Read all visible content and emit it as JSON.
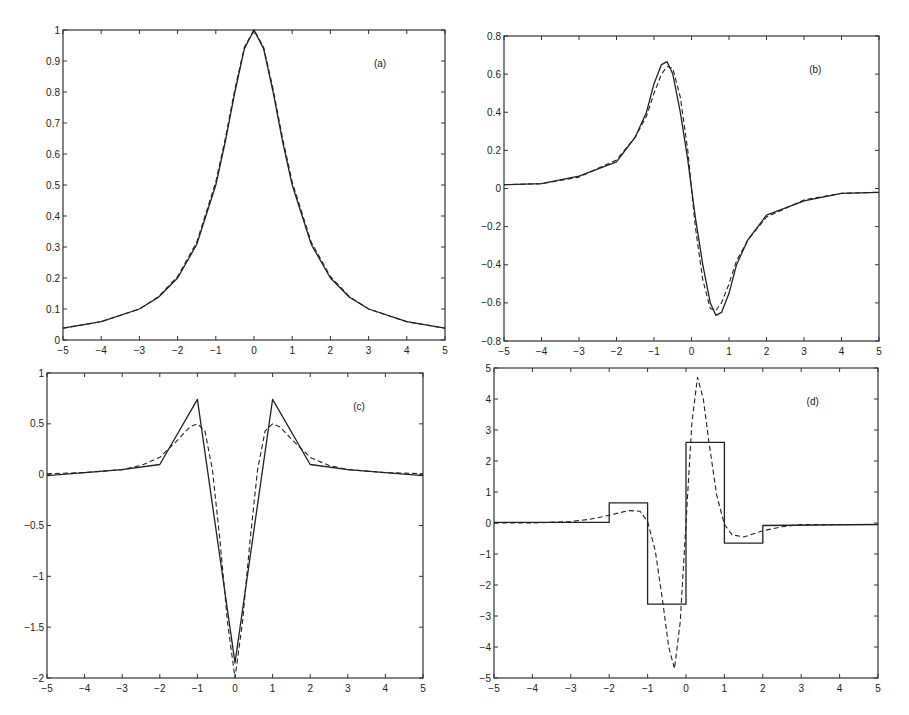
{
  "figure": {
    "panel_labels": [
      "(a)",
      "(b)",
      "(c)",
      "(d)"
    ],
    "colors": {
      "axis": "#333333",
      "line": "#222222",
      "background": "#ffffff"
    }
  },
  "chart_data": [
    {
      "id": "a",
      "type": "line",
      "title": "",
      "annotation": "(a)",
      "xlabel": "",
      "ylabel": "",
      "xlim": [
        -5,
        5
      ],
      "ylim": [
        0,
        1
      ],
      "xticks": [
        -5,
        -4,
        -3,
        -2,
        -1,
        0,
        1,
        2,
        3,
        4,
        5
      ],
      "yticks": [
        0,
        0.1,
        0.2,
        0.3,
        0.4,
        0.5,
        0.6,
        0.7,
        0.8,
        0.9,
        1
      ],
      "ytick_labels": [
        "0",
        "0.1",
        "0.2",
        "0.3",
        "0.4",
        "0.5",
        "0.6",
        "0.7",
        "0.8",
        "0.9",
        "1"
      ],
      "grid": false,
      "x": [
        -5,
        -4,
        -3,
        -2.5,
        -2,
        -1.5,
        -1,
        -0.75,
        -0.5,
        -0.25,
        0,
        0.25,
        0.5,
        0.75,
        1,
        1.5,
        2,
        2.5,
        3,
        4,
        5
      ],
      "series": [
        {
          "name": "solid",
          "style": "solid",
          "values": [
            0.038,
            0.059,
            0.1,
            0.138,
            0.2,
            0.308,
            0.5,
            0.64,
            0.8,
            0.94,
            1.0,
            0.94,
            0.8,
            0.64,
            0.5,
            0.308,
            0.2,
            0.138,
            0.1,
            0.059,
            0.038
          ]
        },
        {
          "name": "dashed",
          "style": "dashed",
          "values": [
            0.038,
            0.059,
            0.1,
            0.14,
            0.205,
            0.315,
            0.51,
            0.65,
            0.81,
            0.945,
            1.0,
            0.945,
            0.81,
            0.65,
            0.51,
            0.315,
            0.205,
            0.14,
            0.1,
            0.059,
            0.038
          ]
        }
      ]
    },
    {
      "id": "b",
      "type": "line",
      "title": "",
      "annotation": "(b)",
      "xlabel": "",
      "ylabel": "",
      "xlim": [
        -5,
        5
      ],
      "ylim": [
        -0.8,
        0.8
      ],
      "xticks": [
        -5,
        -4,
        -3,
        -2,
        -1,
        0,
        1,
        2,
        3,
        4,
        5
      ],
      "yticks": [
        -0.8,
        -0.6,
        -0.4,
        -0.2,
        0,
        0.2,
        0.4,
        0.6,
        0.8
      ],
      "ytick_labels": [
        "-0.8",
        "-0.6",
        "-0.4",
        "-0.2",
        "0",
        "0.2",
        "0.4",
        "0.6",
        "0.8"
      ],
      "grid": false,
      "x": [
        -5,
        -4,
        -3,
        -2,
        -1.5,
        -1.2,
        -1,
        -0.8,
        -0.65,
        -0.5,
        -0.3,
        -0.1,
        0,
        0.1,
        0.3,
        0.5,
        0.65,
        0.8,
        1,
        1.2,
        1.5,
        2,
        3,
        4,
        5
      ],
      "series": [
        {
          "name": "solid",
          "style": "solid",
          "values": [
            0.02,
            0.025,
            0.065,
            0.14,
            0.27,
            0.4,
            0.55,
            0.65,
            0.665,
            0.6,
            0.4,
            0.15,
            0.0,
            -0.15,
            -0.4,
            -0.6,
            -0.665,
            -0.65,
            -0.55,
            -0.4,
            -0.27,
            -0.14,
            -0.065,
            -0.025,
            -0.02
          ]
        },
        {
          "name": "dashed",
          "style": "dashed",
          "values": [
            0.02,
            0.025,
            0.06,
            0.15,
            0.27,
            0.38,
            0.5,
            0.6,
            0.64,
            0.63,
            0.48,
            0.2,
            0.0,
            -0.2,
            -0.48,
            -0.63,
            -0.64,
            -0.6,
            -0.5,
            -0.38,
            -0.27,
            -0.15,
            -0.06,
            -0.025,
            -0.02
          ]
        }
      ]
    },
    {
      "id": "c",
      "type": "line",
      "title": "",
      "annotation": "(c)",
      "xlabel": "",
      "ylabel": "",
      "xlim": [
        -5,
        5
      ],
      "ylim": [
        -2,
        1
      ],
      "xticks": [
        -5,
        -4,
        -3,
        -2,
        -1,
        0,
        1,
        2,
        3,
        4,
        5
      ],
      "yticks": [
        -2,
        -1.5,
        -1,
        -0.5,
        0,
        0.5,
        1
      ],
      "ytick_labels": [
        "-2",
        "-1.5",
        "-1",
        "-0.5",
        "0",
        "0.5",
        "1"
      ],
      "grid": false,
      "series": [
        {
          "name": "solid",
          "style": "solid",
          "x": [
            -5,
            -4,
            -3,
            -2,
            -1,
            0,
            1,
            2,
            3,
            4,
            5
          ],
          "values": [
            -0.01,
            0.02,
            0.05,
            0.1,
            0.74,
            -1.85,
            0.74,
            0.1,
            0.05,
            0.02,
            -0.01
          ]
        },
        {
          "name": "dashed",
          "style": "dashed",
          "x": [
            -5,
            -4,
            -3,
            -2.5,
            -2,
            -1.5,
            -1.2,
            -1,
            -0.8,
            -0.6,
            -0.4,
            -0.2,
            0,
            0.2,
            0.4,
            0.6,
            0.8,
            1,
            1.2,
            1.5,
            2,
            2.5,
            3,
            4,
            5
          ],
          "values": [
            0.01,
            0.02,
            0.05,
            0.09,
            0.17,
            0.35,
            0.47,
            0.5,
            0.43,
            0.05,
            -0.65,
            -1.45,
            -2.0,
            -1.45,
            -0.65,
            0.05,
            0.43,
            0.5,
            0.47,
            0.35,
            0.17,
            0.09,
            0.05,
            0.02,
            0.01
          ]
        }
      ]
    },
    {
      "id": "d",
      "type": "line",
      "title": "",
      "annotation": "(d)",
      "xlabel": "",
      "ylabel": "",
      "xlim": [
        -5,
        5
      ],
      "ylim": [
        -5,
        5
      ],
      "xticks": [
        -5,
        -4,
        -3,
        -2,
        -1,
        0,
        1,
        2,
        3,
        4,
        5
      ],
      "yticks": [
        -5,
        -4,
        -3,
        -2,
        -1,
        0,
        1,
        2,
        3,
        4,
        5
      ],
      "ytick_labels": [
        "-5",
        "-4",
        "-3",
        "-2",
        "-1",
        "0",
        "1",
        "2",
        "3",
        "4",
        "5"
      ],
      "grid": false,
      "series": [
        {
          "name": "solid",
          "style": "solid",
          "shape": "step",
          "x": [
            -5,
            -2,
            -2,
            -1,
            -1,
            0,
            0,
            1,
            1,
            2,
            2,
            5
          ],
          "values": [
            0.02,
            0.02,
            0.65,
            0.65,
            -2.62,
            -2.62,
            2.6,
            2.6,
            -0.65,
            -0.65,
            -0.08,
            -0.05
          ]
        },
        {
          "name": "dashed",
          "style": "dashed",
          "x": [
            -5,
            -4,
            -3,
            -2.5,
            -2,
            -1.5,
            -1.2,
            -1,
            -0.8,
            -0.6,
            -0.45,
            -0.3,
            -0.15,
            0,
            0.15,
            0.3,
            0.45,
            0.6,
            0.8,
            1,
            1.2,
            1.5,
            2,
            2.5,
            3,
            4,
            5
          ],
          "values": [
            0.0,
            0.0,
            0.05,
            0.12,
            0.25,
            0.4,
            0.38,
            0.05,
            -0.9,
            -2.6,
            -4.0,
            -4.7,
            -3.2,
            0.0,
            3.2,
            4.7,
            4.0,
            2.6,
            0.9,
            -0.05,
            -0.38,
            -0.45,
            -0.25,
            -0.12,
            -0.05,
            -0.05,
            -0.05
          ]
        }
      ]
    }
  ]
}
